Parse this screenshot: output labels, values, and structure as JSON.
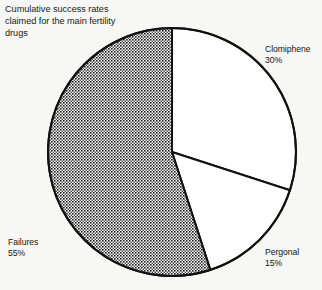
{
  "figure": {
    "top_bleed_text": "•  •   •  •",
    "caption_lines": [
      "Cumulative success rates",
      "claimed for the main fertility",
      "drugs"
    ],
    "background_color": "#f7f7f5",
    "outline_color": "#111111"
  },
  "chart_data": {
    "type": "pie",
    "title": "Cumulative success rates claimed for the main fertility drugs",
    "xlabel": "",
    "ylabel": "",
    "legend_position": "none",
    "grid": false,
    "start_angle_deg": 0,
    "direction": "clockwise",
    "categories": [
      "Clomiphene",
      "Pergonal",
      "Failures"
    ],
    "values": [
      30,
      15,
      55
    ],
    "unit": "%",
    "slices": [
      {
        "label": "Clomiphene",
        "value": 30,
        "value_text": "30%",
        "fill": "white",
        "fill_color": "#ffffff",
        "start_deg": 0,
        "end_deg": 108
      },
      {
        "label": "Pergonal",
        "value": 15,
        "value_text": "15%",
        "fill": "white",
        "fill_color": "#ffffff",
        "start_deg": 108,
        "end_deg": 162
      },
      {
        "label": "Failures",
        "value": 55,
        "value_text": "55%",
        "fill": "crosshatch",
        "fill_color": "#8a8a8a",
        "start_deg": 162,
        "end_deg": 360
      }
    ]
  },
  "labels": {
    "clomiphene": {
      "name": "Clomiphene",
      "pct": "30%"
    },
    "pergonal": {
      "name": "Pergonal",
      "pct": "15%"
    },
    "failures": {
      "name": "Failures",
      "pct": "55%"
    }
  }
}
